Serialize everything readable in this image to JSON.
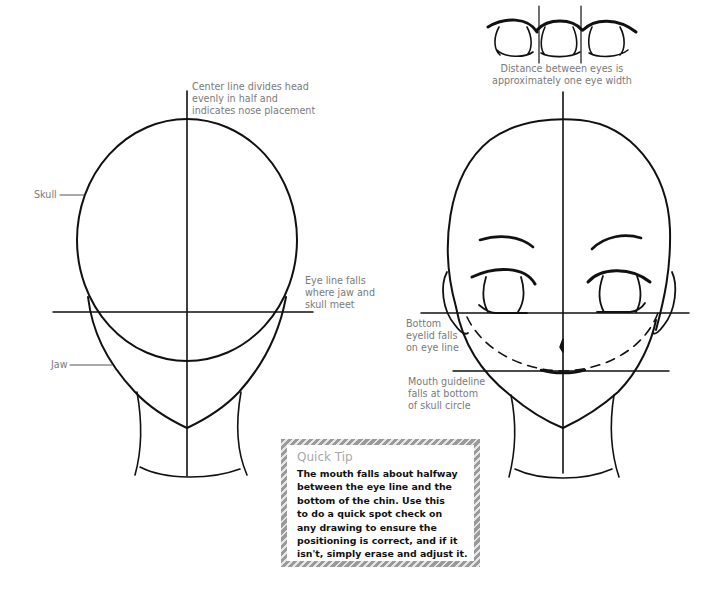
{
  "left_head": {
    "labels": {
      "center_line": "Center line divides head\nevenly in half and\nindicates nose placement",
      "skull": "Skull",
      "eye_line": "Eye line falls\nwhere jaw and\nskull meet",
      "jaw": "Jaw"
    }
  },
  "right_head": {
    "labels": {
      "eye_distance": "Distance between eyes is\napproximately one eye width",
      "bottom_eyelid": "Bottom\neyelid falls\non eye line",
      "mouth_guideline": "Mouth guideline\nfalls at bottom\nof skull circle"
    }
  },
  "quick_tip": {
    "title": "Quick Tip",
    "body": "The mouth falls about halfway\nbetween the eye line and the\nbottom of the chin. Use this\nto do a quick spot check on\nany drawing to ensure the\npositioning is correct, and if it\nisn't, simply erase and adjust it."
  },
  "colors": {
    "line": "#111111",
    "label_text": "#7a7a7a",
    "tip_title": "#a8a8a8",
    "tip_border": "#9a9a9a"
  }
}
